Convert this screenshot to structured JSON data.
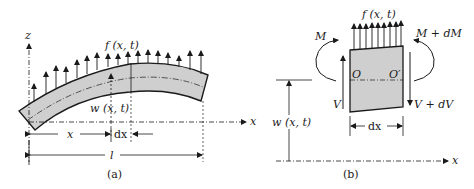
{
  "figure": {
    "panel_a": {
      "caption": "(a)",
      "labels": {
        "z_axis": "z",
        "x_axis": "x",
        "load": "f (x, t)",
        "deflection": "w (x, t)",
        "position": "x",
        "element": "dx",
        "length": "l"
      }
    },
    "panel_b": {
      "caption": "(b)",
      "labels": {
        "load": "f (x, t)",
        "moment_left": "M",
        "moment_right": "M + dM",
        "shear_left": "V",
        "shear_right": "V + dV",
        "point_left": "O",
        "point_right": "O′",
        "deflection": "w (x, t)",
        "element": "dx",
        "x_axis_left": "x",
        "x_axis": "x"
      }
    },
    "colors": {
      "ink": "#1a1a1a",
      "beam_fill": "#cfcfcf"
    }
  }
}
